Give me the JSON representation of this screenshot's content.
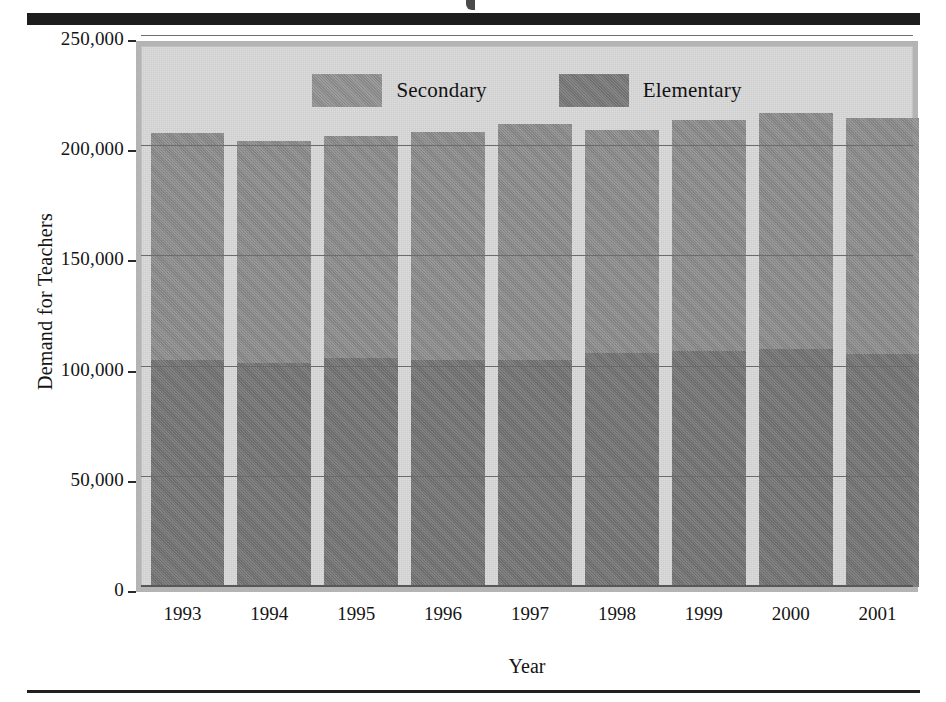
{
  "figure": {
    "background_color": "#ffffff",
    "plot_background_color": "#dcdcdc",
    "frame_border_color": "#b4b4b4"
  },
  "legend": {
    "position": "top-center-inside",
    "items": [
      {
        "label": "Secondary",
        "color": "#8f8f8f",
        "swatch_name": "legend-swatch-secondary"
      },
      {
        "label": "Elementary",
        "color": "#7d7d7d",
        "swatch_name": "legend-swatch-elementary"
      }
    ]
  },
  "axes": {
    "y_title": "Demand for Teachers",
    "x_title": "Year",
    "y_ticks": [
      "0",
      "50,000",
      "100,000",
      "150,000",
      "200,000",
      "250,000"
    ],
    "x_ticks": [
      "1993",
      "1994",
      "1995",
      "1996",
      "1997",
      "1998",
      "1999",
      "2000",
      "2001"
    ]
  },
  "chart_data": {
    "type": "bar",
    "stacked": true,
    "title": "",
    "subtitle": "",
    "xlabel": "Year",
    "ylabel": "Demand for Teachers",
    "categories": [
      "1993",
      "1994",
      "1995",
      "1996",
      "1997",
      "1998",
      "1999",
      "2000",
      "2001"
    ],
    "series": [
      {
        "name": "Elementary",
        "color": "#7d7d7d",
        "values": [
          103000,
          101500,
          104000,
          103000,
          103000,
          106000,
          107000,
          108000,
          105500
        ]
      },
      {
        "name": "Secondary",
        "color": "#8f8f8f",
        "values": [
          103000,
          101000,
          100500,
          103500,
          107000,
          101500,
          105000,
          107000,
          107500
        ]
      }
    ],
    "totals": [
      206000,
      202500,
      204500,
      206500,
      210000,
      207500,
      212000,
      215000,
      213000
    ],
    "ylim": [
      0,
      250000
    ],
    "ytick_values": [
      0,
      50000,
      100000,
      150000,
      200000,
      250000
    ],
    "ytick_labels": [
      "0",
      "50,000",
      "100,000",
      "150,000",
      "200,000",
      "250,000"
    ],
    "grid": true,
    "grid_axis": "y",
    "legend_position": "upper center"
  }
}
